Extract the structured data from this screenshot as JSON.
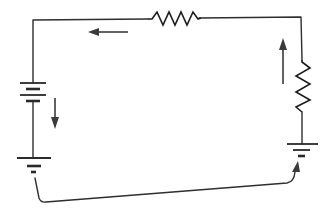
{
  "diagram": {
    "type": "electrical-circuit",
    "colors": {
      "background": "#ffffff",
      "line": "#2e2e2e",
      "arrow": "#3a3a3a"
    },
    "components": [
      {
        "id": "battery",
        "kind": "battery",
        "position": "left side"
      },
      {
        "id": "resistor-top",
        "kind": "resistor",
        "position": "top wire"
      },
      {
        "id": "resistor-right",
        "kind": "resistor",
        "position": "right side"
      },
      {
        "id": "ground-left",
        "kind": "ground",
        "position": "bottom left, below battery"
      },
      {
        "id": "ground-right",
        "kind": "ground",
        "position": "bottom right, below right resistor"
      }
    ],
    "arrows": [
      {
        "id": "arrow-top",
        "direction": "left",
        "position": "below top wire"
      },
      {
        "id": "arrow-battery",
        "direction": "down",
        "position": "right of battery"
      },
      {
        "id": "arrow-right",
        "direction": "up",
        "position": "left of right resistor"
      },
      {
        "id": "arrow-ground-return",
        "direction": "from left ground to right ground",
        "position": "bottom curved path"
      }
    ],
    "labels": []
  }
}
